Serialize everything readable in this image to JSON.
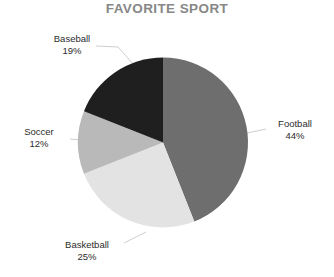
{
  "chart_data": {
    "type": "pie",
    "title": "FAVORITE SPORT",
    "xlabel": "",
    "ylabel": "",
    "legend_position": "none",
    "grid": false,
    "labels_outside": true,
    "start_angle_deg": 0,
    "direction": "clockwise",
    "categories": [
      "Football",
      "Basketball",
      "Soccer",
      "Baseball"
    ],
    "values": [
      44,
      25,
      12,
      19
    ],
    "value_unit": "%",
    "slices": [
      {
        "label": "Football",
        "value": 44,
        "value_text": "44%",
        "color": "#6e6e6e"
      },
      {
        "label": "Basketball",
        "value": 25,
        "value_text": "25%",
        "color": "#e3e3e3"
      },
      {
        "label": "Soccer",
        "value": 12,
        "value_text": "12%",
        "color": "#b9b9b9"
      },
      {
        "label": "Baseball",
        "value": 19,
        "value_text": "19%",
        "color": "#1f1f1f"
      }
    ],
    "total": 100
  },
  "chart": {
    "title": "FAVORITE SPORT",
    "labels": {
      "football_name": "Football",
      "football_value": "44%",
      "basketball_name": "Basketball",
      "basketball_value": "25%",
      "soccer_name": "Soccer",
      "soccer_value": "12%",
      "baseball_name": "Baseball",
      "baseball_value": "19%"
    },
    "colors": {
      "football": "#6e6e6e",
      "basketball": "#e3e3e3",
      "soccer": "#b9b9b9",
      "baseball": "#1f1f1f",
      "title": "#878787",
      "label_text": "#2c2c2c",
      "leader_line": "#cfcfcf",
      "background": "#ffffff"
    }
  }
}
